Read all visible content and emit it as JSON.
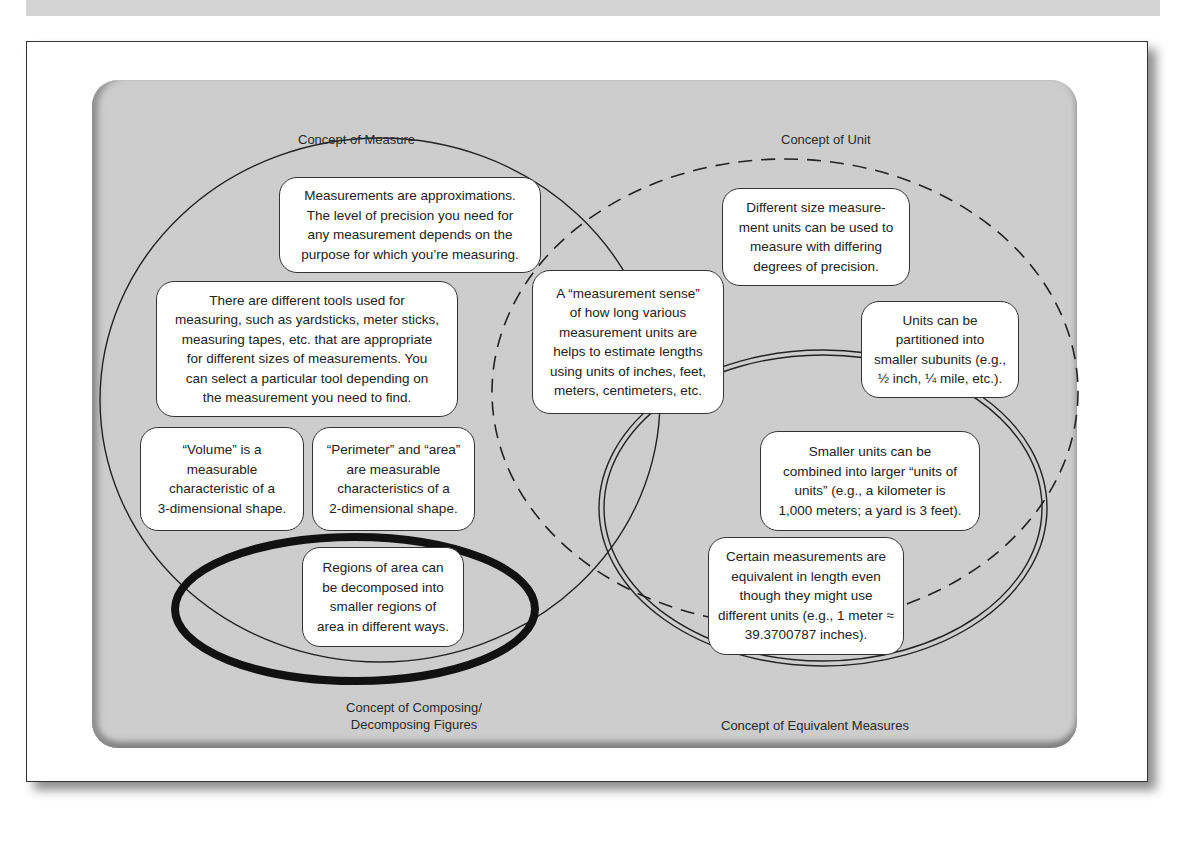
{
  "figure": {
    "circles": [
      {
        "id": "measure",
        "label": "Concept of Measure",
        "style": "solid-thin"
      },
      {
        "id": "unit",
        "label": "Concept of Unit",
        "style": "dashed"
      },
      {
        "id": "composing",
        "label_line1": "Concept of Composing/",
        "label_line2": "Decomposing Figures",
        "style": "solid-thick"
      },
      {
        "id": "equivalent",
        "label": "Concept of Equivalent Measures",
        "style": "double"
      }
    ],
    "boxes": [
      {
        "id": "approximations",
        "text": "Measurements are approximations. The level of precision you need for any measurement depends on the purpose for which you’re measuring."
      },
      {
        "id": "tools",
        "text": "There are different tools used for measuring, such as yardsticks, meter sticks, measuring tapes, etc. that are appropriate for different sizes of measurements. You can select a particular tool depending on the measurement you need to find."
      },
      {
        "id": "volume",
        "text": "“Volume” is a measurable characteristic of a 3-dimensional shape."
      },
      {
        "id": "perimeter",
        "text": "“Perimeter” and “area” are measurable characteristics of a 2-dimensional shape."
      },
      {
        "id": "regions",
        "text": "Regions of area can be decomposed into smaller regions of area in different ways."
      },
      {
        "id": "measurement-sense",
        "text": "A “measurement sense” of how long various measurement units are helps to estimate lengths using units of inches, feet, meters, centimeters, etc."
      },
      {
        "id": "different-size",
        "text": "Different size measurement units can be used to measure with differing degrees of precision."
      },
      {
        "id": "partitioned",
        "text": "Units can be partitioned into smaller subunits (e.g., ½ inch, ¼ mile, etc.)."
      },
      {
        "id": "combined",
        "text": "Smaller units can be combined into larger “units of units” (e.g., a kilometer is 1,000 meters; a yard is 3 feet)."
      },
      {
        "id": "equivalent-lengths",
        "text": "Certain measurements are equivalent in length even though they might use different units (e.g., 1 meter ≈ 39.3700787 inches)."
      }
    ],
    "lines": {
      "approximations": [
        "Measurements are approximations.",
        "The level of precision you need for",
        "any measurement depends on the",
        "purpose for which you’re measuring."
      ],
      "tools": [
        "There are different tools used for",
        "measuring, such as yardsticks, meter sticks,",
        "measuring tapes, etc. that are appropriate",
        "for different sizes of measurements. You",
        "can select a particular tool depending on",
        "the measurement you need to find."
      ],
      "volume": [
        "“Volume” is a",
        "measurable",
        "characteristic of a",
        "3-dimensional shape."
      ],
      "perimeter": [
        "“Perimeter” and “area”",
        "are measurable",
        "characteristics of a",
        "2-dimensional shape."
      ],
      "regions": [
        "Regions of area can",
        "be decomposed into",
        "smaller regions of",
        "area in different ways."
      ],
      "measurement_sense": [
        "A “measurement sense”",
        "of how long various",
        "measurement units are",
        "helps to estimate lengths",
        "using units of inches, feet,",
        "meters, centimeters, etc."
      ],
      "different_size": [
        "Different size measure-",
        "ment units can be used to",
        "measure with differing",
        "degrees of precision."
      ],
      "partitioned": [
        "Units can be",
        "partitioned into",
        "smaller subunits (e.g.,",
        "½ inch, ¼ mile, etc.)."
      ],
      "combined": [
        "Smaller units can be",
        "combined into larger “units of",
        "units” (e.g., a kilometer is",
        "1,000 meters; a yard is 3 feet)."
      ],
      "equivalent_lengths": [
        "Certain measurements are",
        "equivalent in length even",
        "though they might use",
        "different units (e.g., 1 meter ≈",
        "39.3700787 inches)."
      ]
    },
    "labels": {
      "measure": "Concept of Measure",
      "unit": "Concept of Unit",
      "composing_1": "Concept of Composing/",
      "composing_2": "Decomposing Figures",
      "equivalent": "Concept of Equivalent Measures"
    },
    "colors": {
      "panel": "#cdcdcd",
      "box": "#ffffff",
      "stroke": "#222222"
    }
  }
}
